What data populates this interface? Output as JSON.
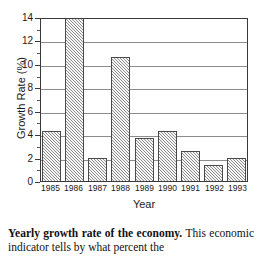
{
  "chart_data": {
    "type": "bar",
    "title": "",
    "xlabel": "Year",
    "ylabel": "Growth Rate (%)",
    "categories": [
      "1985",
      "1986",
      "1987",
      "1988",
      "1989",
      "1990",
      "1991",
      "1992",
      "1993"
    ],
    "values": [
      4.3,
      14.0,
      2.0,
      10.6,
      3.7,
      4.3,
      2.6,
      1.4,
      2.0
    ],
    "ylim": [
      0,
      14
    ],
    "yticks": [
      0,
      2,
      4,
      6,
      8,
      10,
      12,
      14
    ],
    "ytick_labels": [
      "0",
      "2",
      "4",
      "6",
      "8",
      "10",
      "12",
      "14"
    ],
    "grid": true,
    "legend": "none",
    "bar_fill": "gray-hatch",
    "colors": {
      "bar_fill": "#c9c9c9",
      "bar_border": "#4a4a4a",
      "gridline": "#8c8c8c",
      "axis": "#3a3a3a",
      "background": "#ffffff",
      "text": "#111111"
    }
  },
  "caption": {
    "title": "Yearly growth rate of the economy.",
    "body": " This economic indicator tells by what percent the"
  }
}
